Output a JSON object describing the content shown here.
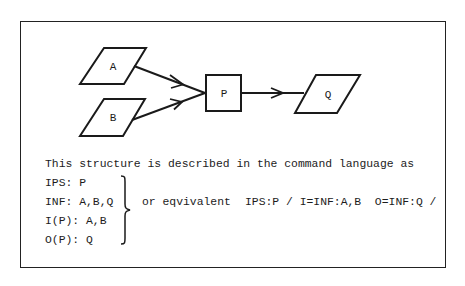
{
  "diagram": {
    "nodes": [
      {
        "id": "A",
        "shape": "parallelogram",
        "label": "A"
      },
      {
        "id": "B",
        "shape": "parallelogram",
        "label": "B"
      },
      {
        "id": "P",
        "shape": "rectangle",
        "label": "P"
      },
      {
        "id": "Q",
        "shape": "parallelogram",
        "label": "Q"
      }
    ],
    "edges": [
      {
        "from": "A",
        "to": "P"
      },
      {
        "from": "B",
        "to": "P"
      },
      {
        "from": "P",
        "to": "Q"
      }
    ],
    "colors": {
      "stroke": "#1a1a1a",
      "background": "#ffffff"
    }
  },
  "description": {
    "intro": "This structure is described in the command language as",
    "lines": [
      "IPS: P",
      "INF: A,B,Q",
      "I(P): A,B",
      "O(P): Q"
    ],
    "or_label": "or eqvivalent",
    "equivalent": "IPS:P / I=INF:A,B  O=INF:Q /"
  }
}
